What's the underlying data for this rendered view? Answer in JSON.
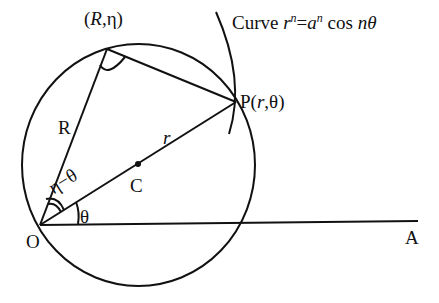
{
  "diagram": {
    "type": "geometry",
    "stroke_color": "#111111",
    "background": "#ffffff",
    "labels": {
      "curve_prefix": "Curve ",
      "curve_r": "r",
      "curve_n1": "n",
      "curve_eq": "=",
      "curve_a": "a",
      "curve_n2": "n",
      "curve_cos": " cos ",
      "curve_ntheta": "nθ",
      "top_point_open": "(",
      "top_point_R": "R",
      "top_point_rest": ",η)",
      "point_P_prefix": "P(",
      "point_P_r": "r",
      "point_P_rest": ",θ)",
      "segment_R": "R",
      "segment_r": "r",
      "center_C": "C",
      "angle_eta_theta": "η−θ",
      "angle_theta": "θ",
      "origin_O": "O",
      "axis_A": "A"
    },
    "points": {
      "O": [
        40,
        224
      ],
      "R_eta": [
        107,
        49
      ],
      "P": [
        236,
        102
      ],
      "C": [
        138,
        164
      ],
      "A_end": [
        418,
        221
      ]
    },
    "circle": {
      "cx": 138,
      "cy": 165,
      "r": 119
    }
  }
}
